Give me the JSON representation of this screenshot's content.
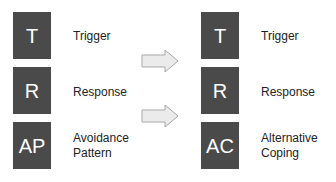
{
  "left_column": [
    {
      "letter": "T",
      "label_line1": "Trigger",
      "label_line2": ""
    },
    {
      "letter": "R",
      "label_line1": "Response",
      "label_line2": ""
    },
    {
      "letter": "AP",
      "label_line1": "Avoidance",
      "label_line2": "Pattern"
    }
  ],
  "right_column": [
    {
      "letter": "T",
      "label_line1": "Trigger",
      "label_line2": ""
    },
    {
      "letter": "R",
      "label_line1": "Response",
      "label_line2": ""
    },
    {
      "letter": "AC",
      "label_line1": "Alternative",
      "label_line2": "Coping"
    }
  ],
  "arrows": [
    "right-arrow-icon",
    "right-arrow-icon"
  ],
  "colors": {
    "box": "#4a4a4a",
    "box_text": "#ffffff",
    "label_text": "#222222",
    "arrow_fill": "#ebebeb",
    "arrow_stroke": "#a8a8a8"
  }
}
